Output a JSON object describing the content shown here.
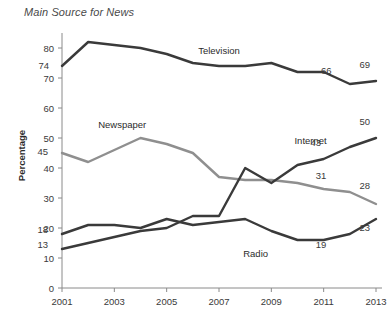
{
  "chart_data": {
    "type": "line",
    "title": "Main Source for News",
    "xlabel": "",
    "ylabel": "Percentage",
    "xlim": [
      2001,
      2013
    ],
    "ylim": [
      0,
      85
    ],
    "y_ticks": [
      0,
      10,
      20,
      30,
      40,
      50,
      60,
      70,
      80
    ],
    "x_ticks": [
      2001,
      2003,
      2005,
      2007,
      2009,
      2011,
      2013
    ],
    "x": [
      2001,
      2002,
      2003,
      2004,
      2005,
      2006,
      2007,
      2008,
      2009,
      2010,
      2011,
      2012,
      2013
    ],
    "grid": false,
    "legend": "inline-annotations",
    "series": [
      {
        "name": "Television",
        "color": "#3a3a3a",
        "values": [
          74,
          82,
          81,
          80,
          78,
          75,
          74,
          74,
          75,
          72,
          72,
          68,
          69
        ],
        "point_labels": [
          {
            "x": 2001,
            "value": 74,
            "text": "74"
          },
          {
            "x": 2011,
            "value": 66,
            "text": "66"
          },
          {
            "x": 2013,
            "value": 69,
            "text": "69"
          }
        ],
        "label_text": "Television"
      },
      {
        "name": "Newspaper",
        "color": "#8f8f8f",
        "values": [
          45,
          42,
          46,
          50,
          48,
          45,
          37,
          36,
          36,
          35,
          33,
          32,
          28
        ],
        "point_labels": [
          {
            "x": 2001,
            "value": 45,
            "text": "45"
          },
          {
            "x": 2011,
            "value": 31,
            "text": "31"
          },
          {
            "x": 2013,
            "value": 28,
            "text": "28"
          }
        ],
        "label_text": "Newspaper"
      },
      {
        "name": "Internet",
        "color": "#3a3a3a",
        "values": [
          13,
          15,
          17,
          19,
          20,
          24,
          24,
          40,
          35,
          41,
          43,
          47,
          50
        ],
        "point_labels": [
          {
            "x": 2001,
            "value": 13,
            "text": "13"
          },
          {
            "x": 2011,
            "value": 43,
            "text": "43"
          },
          {
            "x": 2013,
            "value": 50,
            "text": "50"
          }
        ],
        "label_text": "Internet"
      },
      {
        "name": "Radio",
        "color": "#3a3a3a",
        "values": [
          18,
          21,
          21,
          20,
          23,
          21,
          22,
          23,
          19,
          16,
          16,
          18,
          23
        ],
        "point_labels": [
          {
            "x": 2001,
            "value": 18,
            "text": "18"
          },
          {
            "x": 2011,
            "value": 19,
            "text": "19"
          },
          {
            "x": 2013,
            "value": 23,
            "text": "23"
          }
        ],
        "label_text": "Radio"
      }
    ],
    "annotations": [
      {
        "name": "television-label",
        "text": "Television",
        "x": 2007,
        "y": 78
      },
      {
        "name": "newspaper-label",
        "text": "Newspaper",
        "x": 2003.3,
        "y": 53.5
      },
      {
        "name": "internet-label",
        "text": "Internet",
        "x": 2010.5,
        "y": 48
      },
      {
        "name": "radio-label",
        "text": "Radio",
        "x": 2008.4,
        "y": 10.5
      }
    ],
    "value_callouts": [
      {
        "name": "tv-2001",
        "text": "74",
        "x": 2001,
        "y": 74,
        "dx": -13,
        "dy": 3
      },
      {
        "name": "tv-2011",
        "text": "66",
        "x": 2011.1,
        "y": 71.5,
        "dx": 0,
        "dy": 0
      },
      {
        "name": "tv-2013",
        "text": "69",
        "x": 2013,
        "y": 73.5,
        "dx": -6,
        "dy": 0
      },
      {
        "name": "news-2001",
        "text": "45",
        "x": 2001,
        "y": 45.5,
        "dx": -14,
        "dy": 3
      },
      {
        "name": "news-2011",
        "text": "31",
        "x": 2010.9,
        "y": 36.5,
        "dx": 0,
        "dy": 0
      },
      {
        "name": "news-2013",
        "text": "28",
        "x": 2013,
        "y": 33,
        "dx": -6,
        "dy": 0
      },
      {
        "name": "net-2001",
        "text": "13",
        "x": 2001,
        "y": 14.5,
        "dx": -14,
        "dy": 3
      },
      {
        "name": "net-2011",
        "text": "43",
        "x": 2010.7,
        "y": 47.5,
        "dx": 0,
        "dy": 0
      },
      {
        "name": "net-2013",
        "text": "50",
        "x": 2013,
        "y": 54.5,
        "dx": -6,
        "dy": 0
      },
      {
        "name": "radio-2001",
        "text": "18",
        "x": 2001,
        "y": 19.5,
        "dx": -14,
        "dy": 3
      },
      {
        "name": "radio-2011",
        "text": "19",
        "x": 2010.9,
        "y": 13.5,
        "dx": 0,
        "dy": 0
      },
      {
        "name": "radio-2013",
        "text": "23",
        "x": 2013,
        "y": 19,
        "dx": -6,
        "dy": 0
      }
    ]
  },
  "colors": {
    "axis": "#8a8a8a",
    "dark_series": "#3a3a3a",
    "light_series": "#8f8f8f",
    "text": "#3a3a3a",
    "background": "#ffffff"
  }
}
